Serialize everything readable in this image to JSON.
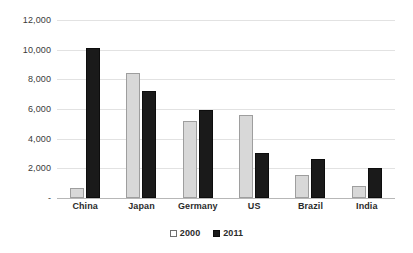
{
  "chart_data": {
    "type": "bar",
    "title": "",
    "subtitle": "",
    "xlabel": "",
    "ylabel": "",
    "categories": [
      "China",
      "Japan",
      "Germany",
      "US",
      "Brazil",
      "India"
    ],
    "series": [
      {
        "name": "2000",
        "color": "#d8d8d8",
        "values": [
          700,
          8400,
          5200,
          5600,
          1550,
          800
        ]
      },
      {
        "name": "2011",
        "color": "#1a1a1a",
        "values": [
          10100,
          7200,
          5900,
          3050,
          2650,
          2050
        ]
      }
    ],
    "ylim": [
      0,
      12000
    ],
    "ytick_values": [
      12000,
      10000,
      8000,
      6000,
      4000,
      2000,
      0
    ],
    "ytick_labels": [
      "12,000",
      "10,000",
      "8,000",
      "6,000",
      "4,000",
      "2,000",
      "-"
    ],
    "grid": true,
    "legend_position": "bottom",
    "annotations": []
  },
  "legend": {
    "items": [
      {
        "label": "2000",
        "swatch": "open-square-swatch"
      },
      {
        "label": "2011",
        "swatch": "filled-square-swatch"
      }
    ]
  }
}
